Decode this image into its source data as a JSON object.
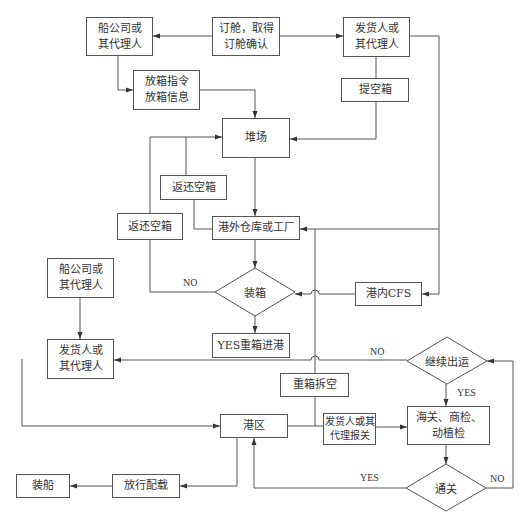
{
  "diagram": {
    "type": "flowchart",
    "nodes": {
      "shipping_co_top": "船公司或\n其代理人",
      "booking": "订舱，取得\n订舱确认",
      "shipper_top": "发货人或\n其代理人",
      "release_order": "放箱指令\n放箱信息",
      "pickup_empty": "提空箱",
      "container_yard": "堆场",
      "return_empty_mid": "返还空箱",
      "return_empty_left": "返还空箱",
      "warehouse_factory": "港外仓库或工厂",
      "stuffing": "装箱",
      "port_cfs": "港内CFS",
      "full_in": "YES重箱进港",
      "shipping_co_left": "船公司或\n其代理人",
      "shipper_left": "发货人或\n其代理人",
      "continue_ship": "继续出运",
      "unstuff": "重箱拆空",
      "port_area": "港区",
      "declare": "发货人或其\n代理报关",
      "inspection": "海关、商检、\n动植检",
      "clearance": "通关",
      "loading": "装船",
      "release_stowage": "放行配载"
    },
    "edge_labels": {
      "stuffing_no": "NO",
      "continue_no": "NO",
      "continue_yes": "YES",
      "clearance_yes": "YES",
      "clearance_no": "NO"
    }
  }
}
